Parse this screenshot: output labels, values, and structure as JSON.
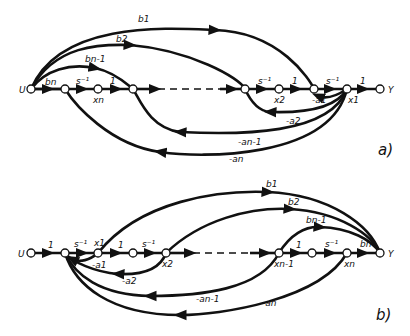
{
  "diagram_a": {
    "caption": "a)",
    "input": "U",
    "output": "Y",
    "forward_labels": {
      "bn": "bn",
      "s1": "s⁻¹",
      "one1": "1",
      "s2": "s⁻¹",
      "one2": "1",
      "s3": "s⁻¹",
      "one_out": "1"
    },
    "state_labels": {
      "xn": "xn",
      "x2": "x2",
      "x1": "x1"
    },
    "feedforward": [
      "b1",
      "b2",
      "bn-1"
    ],
    "feedback": [
      "-a1",
      "-a2",
      "-an-1",
      "-an"
    ]
  },
  "diagram_b": {
    "caption": "b)",
    "input": "U",
    "output": "Y",
    "forward_labels": {
      "one_in": "1",
      "s1": "s⁻¹",
      "one1": "1",
      "s2": "s⁻¹",
      "one2": "1",
      "s3": "s⁻¹",
      "bn": "bn"
    },
    "state_labels": {
      "x1": "x1",
      "x2": "x2",
      "xn1": "xn-1",
      "xn": "xn"
    },
    "feedforward": [
      "b1",
      "b2",
      "bn-1"
    ],
    "feedback": [
      "-a1",
      "-a2",
      "-an-1",
      "-an"
    ]
  }
}
